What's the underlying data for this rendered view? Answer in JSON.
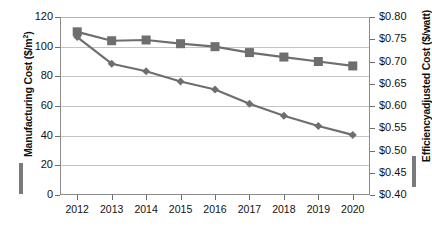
{
  "chart_data": {
    "type": "line",
    "title": "",
    "xlabel": "",
    "categories": [
      "2012",
      "2013",
      "2014",
      "2015",
      "2016",
      "2017",
      "2018",
      "2019",
      "2020"
    ],
    "grid": true,
    "legend_position": "axis-titles",
    "series": [
      {
        "name": "Manufacturing Cost ($/m²)",
        "axis": "left",
        "marker": "square",
        "color": "#6e6e6e",
        "values": [
          110,
          104,
          104.5,
          102,
          100,
          96,
          93,
          90,
          87
        ]
      },
      {
        "name": "Efficiencyadjusted Cost ($/watt)",
        "axis": "right",
        "marker": "diamond",
        "color": "#6e6e6e",
        "values": [
          0.755,
          0.695,
          0.678,
          0.655,
          0.637,
          0.605,
          0.578,
          0.555,
          0.535
        ]
      }
    ],
    "left_axis": {
      "label": "Manufacturing Cost ($/m²)",
      "label_main": "Manufacturing Cost ($/m",
      "label_sup": "2",
      "label_tail": ")",
      "ylim": [
        0,
        120
      ],
      "ticks": [
        0,
        20,
        40,
        60,
        80,
        100,
        120
      ],
      "tick_labels": [
        "0",
        "20",
        "40",
        "60",
        "80",
        "100",
        "120"
      ]
    },
    "right_axis": {
      "label": "Efficiencyadjusted Cost ($/watt)",
      "ylim": [
        0.4,
        0.8
      ],
      "ticks": [
        0.4,
        0.45,
        0.5,
        0.55,
        0.6,
        0.65,
        0.7,
        0.75,
        0.8
      ],
      "tick_labels": [
        "$0.40",
        "$0.45",
        "$0.50",
        "$0.55",
        "$0.60",
        "$0.65",
        "$0.70",
        "$0.75",
        "$0.80"
      ]
    }
  },
  "caption": {
    "text": ""
  },
  "colors": {
    "series": "#6e6e6e",
    "grid": "#c4c4c4",
    "axis": "#8c8c8c",
    "text": "#111111"
  }
}
